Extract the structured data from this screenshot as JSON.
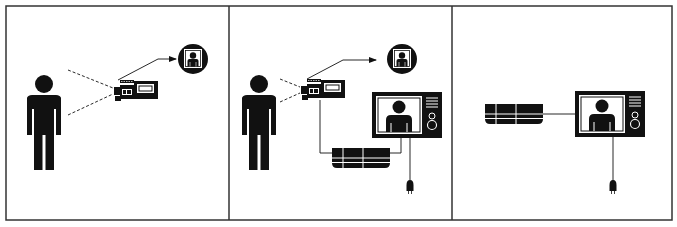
{
  "diagram": {
    "colors": {
      "ink": "#111111",
      "frame": "#333333",
      "background": "#ffffff"
    },
    "panels": [
      {
        "id": "panel-1",
        "elements": [
          "person",
          "camcorder",
          "dashed-view-lines",
          "arrow",
          "picture-circle"
        ]
      },
      {
        "id": "panel-2",
        "elements": [
          "person",
          "camcorder",
          "dashed-view-lines",
          "arrow",
          "picture-circle",
          "tv",
          "vcr",
          "cables",
          "plug"
        ]
      },
      {
        "id": "panel-3",
        "elements": [
          "vcr",
          "tv",
          "cable",
          "plug"
        ]
      }
    ]
  }
}
